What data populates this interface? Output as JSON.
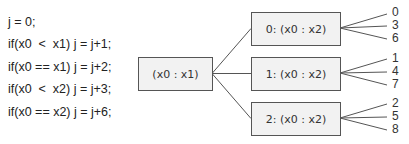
{
  "code": {
    "lines": [
      "j = 0;",
      "if(x0  <  x1) j = j+1;",
      "if(x0 == x1) j = j+2;",
      "if(x0  <  x2) j = j+3;",
      "if(x0 == x2) j = j+6;"
    ]
  },
  "tree": {
    "root": {
      "label": "(x0 : x1)"
    },
    "children": [
      {
        "label": "0: (x0 : x2)",
        "leaves": [
          "0",
          "3",
          "6"
        ]
      },
      {
        "label": "1: (x0 : x2)",
        "leaves": [
          "1",
          "4",
          "7"
        ]
      },
      {
        "label": "2: (x0 : x2)",
        "leaves": [
          "2",
          "5",
          "8"
        ]
      }
    ]
  },
  "colors": {
    "box_fill": "#f2f2f2",
    "box_border": "#555555",
    "line": "#555555",
    "text": "#333333"
  }
}
